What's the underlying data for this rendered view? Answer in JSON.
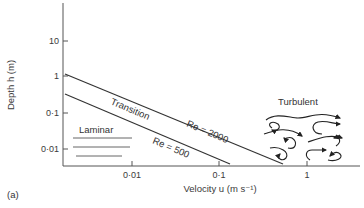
{
  "figure": {
    "panel_label": "(a)",
    "y_axis": {
      "title": "Depth h (m)",
      "ticks": [
        {
          "label": "10",
          "value": 10
        },
        {
          "label": "1",
          "value": 1
        },
        {
          "label": "0·1",
          "value": 0.1
        },
        {
          "label": "0·01",
          "value": 0.01
        }
      ],
      "scale": "log"
    },
    "x_axis": {
      "title": "Velocity u (m s⁻¹)",
      "ticks": [
        {
          "label": "0·01",
          "value": 0.01
        },
        {
          "label": "0·1",
          "value": 0.1
        },
        {
          "label": "1",
          "value": 1
        }
      ],
      "scale": "log"
    },
    "regions": {
      "laminar": "Laminar",
      "transition": "Transition",
      "turbulent": "Turbulent"
    },
    "boundaries": [
      {
        "label": "Re = 2000"
      },
      {
        "label": "Re = 500"
      }
    ],
    "colors": {
      "line": "#333333",
      "text": "#3a3a3a",
      "background": "#ffffff"
    }
  }
}
